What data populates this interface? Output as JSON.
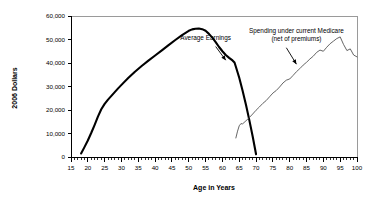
{
  "chart_data": {
    "type": "line",
    "title": "",
    "xlabel": "Age in Years",
    "ylabel": "2006 Dollars",
    "xlim": [
      15,
      100
    ],
    "ylim": [
      0,
      60000
    ],
    "grid": false,
    "legend_position": "none",
    "x_ticks": [
      15,
      20,
      25,
      30,
      35,
      40,
      45,
      50,
      55,
      60,
      65,
      70,
      75,
      80,
      85,
      90,
      95,
      100
    ],
    "x_tick_labels": [
      "15",
      "20",
      "25",
      "30",
      "35",
      "40",
      "45",
      "50",
      "55",
      "60",
      "65",
      "70",
      "75",
      "80",
      "85",
      "90",
      "95",
      "100"
    ],
    "x_minor_tick_step": 1,
    "y_ticks": [
      0,
      10000,
      20000,
      30000,
      40000,
      50000,
      60000
    ],
    "y_tick_labels": [
      "0",
      "10,000",
      "20,000",
      "30,000",
      "40,000",
      "50,000",
      "60,000"
    ],
    "series": [
      {
        "name": "Average Earnings",
        "color": "#000000",
        "line_width": "thick",
        "x": [
          18,
          19,
          20,
          21,
          22,
          23,
          24,
          25,
          26,
          27,
          28,
          29,
          30,
          32,
          34,
          36,
          38,
          40,
          42,
          44,
          46,
          48,
          50,
          51,
          52,
          53,
          54,
          55,
          56,
          57,
          58,
          59,
          60,
          61,
          62,
          63,
          63.6,
          64,
          65,
          66,
          67,
          68,
          69,
          70
        ],
        "y": [
          1500,
          4200,
          7000,
          10200,
          13600,
          17200,
          20300,
          22600,
          24400,
          26000,
          27600,
          29200,
          30700,
          33600,
          36300,
          38700,
          41000,
          43200,
          45400,
          47600,
          49800,
          51900,
          53700,
          54300,
          54600,
          54700,
          54400,
          53700,
          52400,
          50800,
          48900,
          46800,
          45000,
          43400,
          42200,
          41100,
          40200,
          38400,
          33700,
          28200,
          22200,
          15700,
          8700,
          1200
        ]
      },
      {
        "name": "Spending under current Medicare (net of premiums)",
        "color": "#4a4a4a",
        "line_width": "thin",
        "x": [
          64,
          64.5,
          65,
          65.5,
          66,
          67,
          68,
          69,
          70,
          71,
          72,
          73,
          74,
          75,
          76,
          77,
          78,
          79,
          80,
          81,
          82,
          83,
          84,
          85,
          86,
          87,
          88,
          89,
          90,
          91,
          92,
          93,
          94,
          95,
          96,
          97,
          98,
          99,
          100
        ],
        "y": [
          8100,
          11000,
          13300,
          14200,
          14100,
          15400,
          16800,
          18300,
          19900,
          21300,
          22800,
          24000,
          25600,
          27200,
          28300,
          29800,
          31500,
          32700,
          33200,
          34700,
          36300,
          37600,
          39100,
          40300,
          41700,
          42900,
          44500,
          45500,
          45000,
          46700,
          48200,
          49300,
          50400,
          51100,
          47900,
          45300,
          46000,
          43400,
          42600
        ]
      }
    ],
    "annotations": [
      {
        "name": "average-earnings",
        "lines": [
          "Average Earnings"
        ],
        "text_x": 55,
        "text_y": 49600,
        "arrow_from_x": 58,
        "arrow_from_y": 47000,
        "arrow_to_x": 61,
        "arrow_to_y": 41200
      },
      {
        "name": "medicare-spending",
        "lines": [
          "Spending under current Medicare",
          "(net of premiums)"
        ],
        "text_x": 82,
        "text_y": 52800,
        "arrow_from_x": 79,
        "arrow_from_y": 46500,
        "arrow_to_x": 82,
        "arrow_to_y": 39500
      }
    ]
  }
}
